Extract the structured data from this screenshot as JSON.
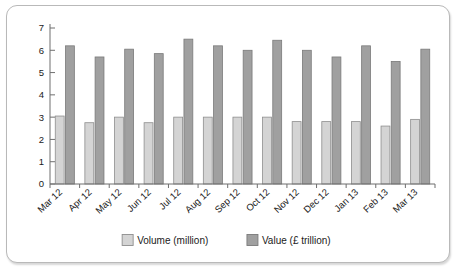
{
  "chart_data": {
    "type": "bar",
    "title": "",
    "subtitle": "",
    "xlabel": "",
    "ylabel": "",
    "ylim": [
      0,
      7
    ],
    "yticks": [
      0,
      1,
      2,
      3,
      4,
      5,
      6,
      7
    ],
    "grid": false,
    "legend_position": "bottom",
    "categories": [
      "Mar 12",
      "Apr 12",
      "May 12",
      "Jun 12",
      "Jul 12",
      "Aug 12",
      "Sep 12",
      "Oct 12",
      "Nov 12",
      "Dec 12",
      "Jan 13",
      "Feb 13",
      "Mar 13"
    ],
    "series": [
      {
        "name": "Volume (million)",
        "color": "#d4d4d4",
        "values": [
          3.05,
          2.75,
          3.0,
          2.75,
          3.0,
          3.0,
          3.0,
          3.0,
          2.8,
          2.8,
          2.8,
          2.6,
          2.9
        ]
      },
      {
        "name": "Value (£ trillion)",
        "color": "#a0a0a0",
        "values": [
          6.2,
          5.7,
          6.05,
          5.85,
          6.5,
          6.2,
          6.0,
          6.45,
          6.0,
          5.7,
          6.2,
          5.5,
          6.05
        ]
      }
    ]
  },
  "legend": {
    "items": [
      {
        "label": "Volume (million)",
        "swatch": "volume-swatch"
      },
      {
        "label": "Value (£ trillion)",
        "swatch": "value-swatch"
      }
    ]
  },
  "colors": {
    "volume": "#d4d4d4",
    "value": "#a0a0a0",
    "axis": "#6f6f6f",
    "frame": "#b9b9b9",
    "background": "#ffffff"
  }
}
